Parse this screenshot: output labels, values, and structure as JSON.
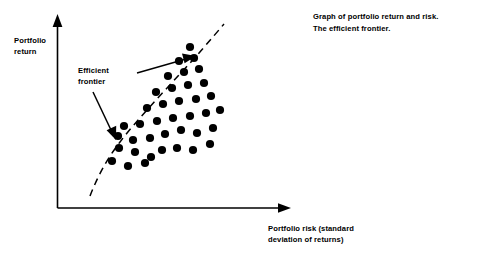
{
  "figure": {
    "caption": "Graph of portfolio return and risk.\nThe efficient frontier.",
    "y_axis_label": "Portfolio\nreturn",
    "x_axis_label": "Portfolio risk (standard\ndeviation of returns)",
    "annotation_label": "Efficient\nfrontier",
    "ink_color": "#000000",
    "background_color": "#ffffff"
  },
  "chart_data": {
    "type": "scatter",
    "title": "Graph of portfolio return and risk. The efficient frontier.",
    "xlabel": "Portfolio risk (standard deviation of returns)",
    "ylabel": "Portfolio return",
    "grid": false,
    "legend": false,
    "axes_style": "arrow-axes, no tick labels",
    "xlim": [
      0,
      100
    ],
    "ylim": [
      0,
      100
    ],
    "annotations": [
      {
        "text": "Efficient frontier",
        "points_to": "upper dashed boundary curve",
        "arrows": 2
      }
    ],
    "series": [
      {
        "name": "Portfolio opportunity set",
        "marker": "filled-circle",
        "color": "#000000",
        "points": [
          [
            119,
            148
          ],
          [
            135,
            152
          ],
          [
            151,
            157
          ],
          [
            112,
            161
          ],
          [
            128,
            166
          ],
          [
            145,
            163
          ],
          [
            162,
            150
          ],
          [
            177,
            148
          ],
          [
            193,
            150
          ],
          [
            210,
            144
          ],
          [
            118,
            136
          ],
          [
            133,
            140
          ],
          [
            150,
            138
          ],
          [
            165,
            134
          ],
          [
            181,
            130
          ],
          [
            197,
            133
          ],
          [
            213,
            128
          ],
          [
            124,
            126
          ],
          [
            140,
            124
          ],
          [
            157,
            121
          ],
          [
            173,
            118
          ],
          [
            190,
            116
          ],
          [
            206,
            113
          ],
          [
            220,
            110
          ],
          [
            147,
            108
          ],
          [
            163,
            104
          ],
          [
            179,
            101
          ],
          [
            196,
            99
          ],
          [
            211,
            96
          ],
          [
            156,
            92
          ],
          [
            172,
            88
          ],
          [
            188,
            85
          ],
          [
            204,
            83
          ],
          [
            168,
            76
          ],
          [
            184,
            72
          ],
          [
            199,
            69
          ],
          [
            179,
            61
          ],
          [
            194,
            58
          ],
          [
            190,
            47
          ]
        ]
      }
    ],
    "efficient_frontier": {
      "style": "dashed",
      "description": "upward-sloping concave dashed curve tracing the upper-left boundary of the opportunity set",
      "path": [
        [
          90,
          196
        ],
        [
          103,
          163
        ],
        [
          120,
          140
        ],
        [
          145,
          112
        ],
        [
          175,
          80
        ],
        [
          205,
          46
        ],
        [
          222,
          26
        ]
      ]
    }
  }
}
